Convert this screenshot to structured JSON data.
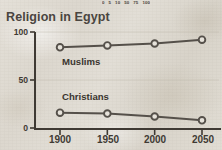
{
  "chart_data": {
    "type": "line",
    "title": "Religion in Egypt",
    "xlabel": "",
    "ylabel": "",
    "x": [
      1900,
      1950,
      2000,
      2050
    ],
    "xtick_labels": [
      "1900",
      "1950",
      "2000",
      "2050"
    ],
    "ytick_labels": [
      "0",
      "50",
      "100"
    ],
    "yticks": [
      0,
      50,
      100
    ],
    "ylim": [
      0,
      100
    ],
    "xlim": [
      1880,
      2070
    ],
    "grid": "horizontal-faint",
    "legend": "inline-series-labels",
    "series": [
      {
        "name": "Muslims",
        "label": "Muslims",
        "values": [
          84,
          86,
          88,
          92
        ],
        "color": "#55504a",
        "marker": "open-circle"
      },
      {
        "name": "Christians",
        "label": "Christians",
        "values": [
          16,
          15,
          12,
          8
        ],
        "color": "#55504a",
        "marker": "open-circle"
      }
    ],
    "colors": {
      "line": "#55504a",
      "marker_fill": "#e6e2da",
      "axis": "#3f3a34",
      "grid": "#bdb7ab",
      "text": "#3f3a34",
      "title": "#4a4540",
      "background": "#dedad2"
    }
  },
  "scale_strip": {
    "name": "cut-off-scale-legend",
    "ticks": [
      "0",
      "5",
      "10",
      "50",
      "75",
      "100"
    ]
  },
  "axes": {
    "y": {
      "labels": [
        "100",
        "50",
        "0"
      ]
    },
    "x": {
      "labels": [
        "1900",
        "1950",
        "2000",
        "2050"
      ]
    }
  },
  "series_labels": {
    "muslims": "Muslims",
    "christians": "Christians"
  }
}
